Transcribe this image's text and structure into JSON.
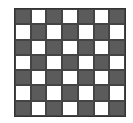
{
  "board": {
    "rows": 7,
    "cols": 7,
    "top_left": "dark",
    "colors": {
      "dark": "#5b5b5b",
      "light": "#ffffff"
    }
  }
}
